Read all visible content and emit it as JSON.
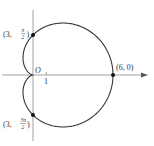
{
  "figure": {
    "curve": "cardioid r = 3 + 3cosθ",
    "origin_label": "O",
    "tick_label": "1",
    "points": [
      {
        "label_prefix": "(3, ",
        "num": "π",
        "den": "2",
        "label_suffix": ")"
      },
      {
        "label": "(6, 0)"
      },
      {
        "label_prefix": "(3, ",
        "num": "3π",
        "den": "2",
        "label_suffix": ")"
      }
    ]
  },
  "colors": {
    "curve": "#333333",
    "axis": "#888888",
    "point": "#111111"
  }
}
